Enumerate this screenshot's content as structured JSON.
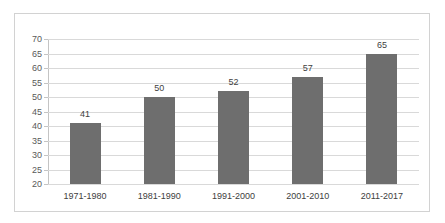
{
  "chart_data": {
    "type": "bar",
    "title": "",
    "subtitle": "",
    "xlabel": "",
    "ylabel": "",
    "categories": [
      "1971-1980",
      "1981-1990",
      "1991-2000",
      "2001-2010",
      "2011-2017"
    ],
    "values": [
      41,
      50,
      52,
      57,
      65
    ],
    "data_labels": [
      "41",
      "50",
      "52",
      "57",
      "65"
    ],
    "series": [
      {
        "name": "",
        "values": [
          41,
          50,
          52,
          57,
          65
        ]
      }
    ],
    "ylim": [
      20,
      70
    ],
    "ytick_step": 5,
    "ytick_labels": [
      "20",
      "25",
      "30",
      "35",
      "40",
      "45",
      "50",
      "55",
      "60",
      "65",
      "70"
    ],
    "ytick_values": [
      20,
      25,
      30,
      35,
      40,
      45,
      50,
      55,
      60,
      65,
      70
    ],
    "grid": {
      "horizontal": true,
      "vertical": false
    },
    "legend": {
      "visible": false,
      "position": "none",
      "entries": []
    },
    "annotations": [],
    "colors": {
      "bar": "#6e6e6e",
      "gridline": "#d9d9d9",
      "axis_line": "#c4c4c4",
      "frame_border": "#d2d2d2",
      "tick_label": "#595959",
      "category_label": "#404040",
      "data_label": "#3f3f3f",
      "background": "#ffffff"
    }
  }
}
